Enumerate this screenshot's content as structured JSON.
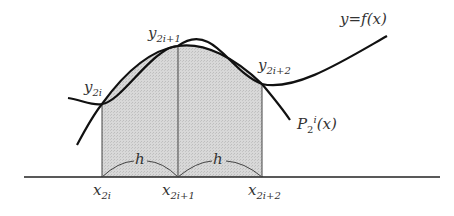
{
  "diagram": {
    "curve_label": {
      "var": "y",
      "eq": "=",
      "func": "f",
      "arg": "(x)"
    },
    "interp_label": {
      "base": "P",
      "sub": "2",
      "sup": "i",
      "arg": "(x)"
    },
    "points": [
      {
        "base": "y",
        "sub": "2i"
      },
      {
        "base": "y",
        "sub": "2i+1"
      },
      {
        "base": "y",
        "sub": "2i+2"
      }
    ],
    "ticks": [
      {
        "base": "x",
        "sub": "2i"
      },
      {
        "base": "x",
        "sub": "2i+1"
      },
      {
        "base": "x",
        "sub": "2i+2"
      }
    ],
    "spacing_labels": [
      "h",
      "h"
    ],
    "colors": {
      "stroke": "#111111",
      "fill": "#d4d4d4",
      "text": "#333333",
      "axis": "#222222"
    }
  }
}
